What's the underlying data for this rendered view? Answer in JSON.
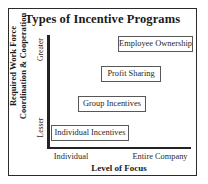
{
  "chart_data": {
    "type": "scatter",
    "title": "Types of Incentive Programs",
    "xlabel": "Level of Focus",
    "ylabel_line1": "Required Work Force",
    "ylabel_line2": "Coordination & Cooperation",
    "xticks": [
      "Individual",
      "Entire Company"
    ],
    "yticks": [
      "Lesser",
      "Greater"
    ],
    "grid": false,
    "legend": "none",
    "axis_style": "two-axis L-shape, no numeric scale",
    "items": [
      {
        "label": "Individual Incentives",
        "x": "Individual",
        "y": "Lesser"
      },
      {
        "label": "Group Incentives",
        "x": "Individual-to-Mid",
        "y": "Low-Mid"
      },
      {
        "label": "Profit Sharing",
        "x": "Mid-to-Entire Company",
        "y": "Mid-High"
      },
      {
        "label": "Employee Ownership",
        "x": "Entire Company",
        "y": "Greater"
      }
    ]
  },
  "colors": {
    "frame": "#2b2b2b",
    "axis": "#232323",
    "box_border": "#585858",
    "text": "#1a1a1a",
    "background": "#ffffff"
  }
}
